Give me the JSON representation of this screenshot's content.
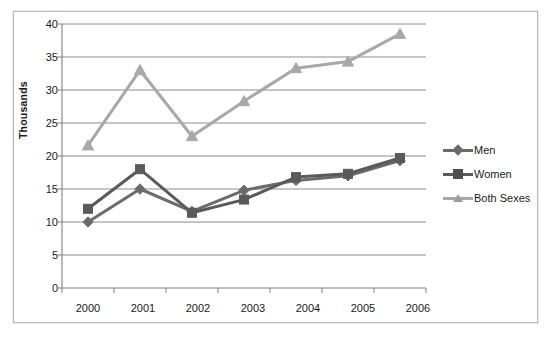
{
  "chart_data": {
    "type": "line",
    "title": "",
    "subtitle": "",
    "xlabel": "",
    "ylabel": "Thousands",
    "categories": [
      "2000",
      "2001",
      "2002",
      "2003",
      "2004",
      "2005",
      "2006"
    ],
    "x": [
      2000,
      2001,
      2002,
      2003,
      2004,
      2005,
      2006
    ],
    "series": [
      {
        "name": "Men",
        "marker": "diamond",
        "color": "#6b6b6b",
        "values": [
          10.0,
          15.0,
          11.6,
          14.8,
          16.3,
          17.0,
          19.3
        ]
      },
      {
        "name": "Women",
        "marker": "square",
        "color": "#5a5a5a",
        "values": [
          12.0,
          18.0,
          11.4,
          13.4,
          16.8,
          17.3,
          19.7
        ]
      },
      {
        "name": "Both Sexes",
        "marker": "triangle",
        "color": "#a8a8a8",
        "values": [
          21.6,
          33.0,
          23.0,
          28.3,
          33.3,
          34.3,
          38.5
        ]
      }
    ],
    "ylim": [
      0,
      40
    ],
    "ytick_labels": [
      "0",
      "5",
      "10",
      "15",
      "20",
      "25",
      "30",
      "35",
      "40"
    ],
    "yticks": [
      0,
      5,
      10,
      15,
      20,
      25,
      30,
      35,
      40
    ],
    "grid": true,
    "grid_axis": "y",
    "legend_position": "right"
  },
  "axis": {
    "y_title": "Thousands",
    "y_labels": [
      "40",
      "35",
      "30",
      "25",
      "20",
      "15",
      "10",
      "5",
      "0"
    ],
    "x_labels": [
      "2000",
      "2001",
      "2002",
      "2003",
      "2004",
      "2005",
      "2006"
    ]
  },
  "legend": {
    "entries": [
      {
        "label": "Men",
        "marker_icon": "diamond-marker-icon"
      },
      {
        "label": "Women",
        "marker_icon": "square-marker-icon"
      },
      {
        "label": "Both Sexes",
        "marker_icon": "triangle-marker-icon"
      }
    ]
  },
  "colors": {
    "men": "#6b6b6b",
    "women": "#5a5a5a",
    "both_sexes": "#a8a8a8",
    "gridline": "#808080",
    "axis": "#808080",
    "frame": "#b9b9b9",
    "text": "#1a1a1a",
    "background": "#ffffff"
  }
}
